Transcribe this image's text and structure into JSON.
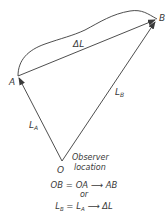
{
  "diagram": {
    "points": {
      "A": {
        "label": "A",
        "x": 18,
        "y": 76
      },
      "B": {
        "label": "B",
        "x": 157,
        "y": 19
      },
      "O": {
        "label": "O",
        "x": 62,
        "y": 161
      }
    },
    "vectors": [
      {
        "from": "O",
        "to": "A",
        "label": "L",
        "subscript": "A"
      },
      {
        "from": "O",
        "to": "B",
        "label": "L",
        "subscript": "B"
      },
      {
        "from": "A",
        "to": "B",
        "label": "ΔL"
      }
    ],
    "curve": {
      "from": "A",
      "to": "B",
      "description": "curved path between A and B"
    },
    "observer_label_line1": "Observer",
    "observer_label_line2": "location",
    "equation1": "OB = OA ⟶ AB",
    "or_text": "or",
    "equation2_lhs": "L",
    "equation2_lhs_sub": "B",
    "equation2_mid": " = L",
    "equation2_mid_sub": "A",
    "equation2_rhs": " ⟶ ΔL",
    "colors": {
      "stroke": "#3a3a3a",
      "background": "#ffffff"
    }
  }
}
